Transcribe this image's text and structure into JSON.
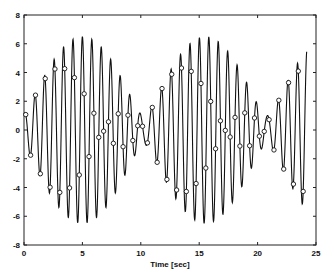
{
  "chart_data": {
    "type": "line",
    "title": "",
    "xlabel": "Time [sec]",
    "ylabel": "",
    "xlim": [
      0,
      25
    ],
    "ylim": [
      -8,
      8
    ],
    "xticks": [
      0,
      5,
      10,
      15,
      20,
      25
    ],
    "yticks": [
      -8,
      -6,
      -4,
      -2,
      0,
      2,
      4,
      6,
      8
    ],
    "grid": false,
    "legend": null,
    "series": [
      {
        "name": "signal",
        "style": "solid line",
        "description": "Beating sinusoid (sum of two close-frequency cosines); envelope min ~1 near t=0.5, 13, 24 and max ~6.5 near t=8 and t=18.5",
        "model": {
          "components": [
            {
              "amplitude": 3.75,
              "frequency_hz": 1.2,
              "phase_rad": 0.0
            },
            {
              "amplitude": 2.75,
              "frequency_hz": 1.295,
              "phase_rad": 3.3
            }
          ],
          "t_start": 0,
          "t_end": 24.2,
          "dt": 0.02
        }
      },
      {
        "name": "samples",
        "style": "open circle markers",
        "description": "Sampled points (aliased), forming two slowly varying trails",
        "sample_period_sec": 0.4167,
        "t_start": 0.15,
        "count": 58
      }
    ]
  },
  "axes": {
    "x_tick_labels": [
      "0",
      "5",
      "10",
      "15",
      "20",
      "25"
    ],
    "y_tick_labels": [
      "8",
      "6",
      "4",
      "2",
      "0",
      "-2",
      "-4",
      "-6",
      "-8"
    ],
    "xlabel": "Time [sec]"
  }
}
